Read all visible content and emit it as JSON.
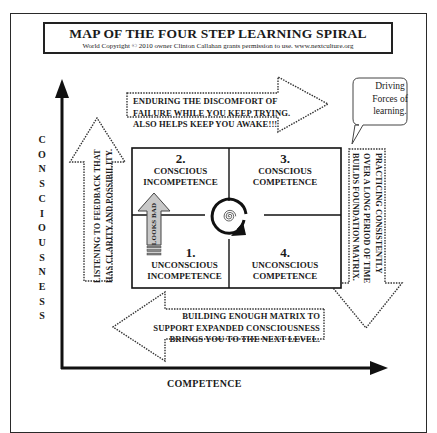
{
  "title": {
    "main": "MAP OF THE FOUR STEP LEARNING SPIRAL",
    "subtitle": "World Copyright © 2010 owner Clinton Callahan grants permission to use. www.nextculture.org"
  },
  "axes": {
    "y_label_letters": [
      "C",
      "O",
      "N",
      "S",
      "C",
      "I",
      "O",
      "U",
      "S",
      "N",
      "E",
      "S",
      "S"
    ],
    "y_label": "CONSCIOUSNESS",
    "x_label": "COMPETENCE"
  },
  "quadrants": [
    {
      "number": "2.",
      "line1": "CONSCIOUS",
      "line2": "INCOMPETENCE"
    },
    {
      "number": "3.",
      "line1": "CONSCIOUS",
      "line2": "COMPETENCE"
    },
    {
      "number": "1.",
      "line1": "UNCONSCIOUS",
      "line2": "INCOMPETENCE"
    },
    {
      "number": "4.",
      "line1": "UNCONSCIOUS",
      "line2": "COMPETENCE"
    }
  ],
  "arrows": {
    "top": {
      "lines": [
        "ENDURING THE DISCOMFORT OF",
        "FAILURE WHILE YOU KEEP TRYING.",
        "ALSO HELPS KEEP YOU AWAKE!!!"
      ]
    },
    "right": {
      "lines": [
        "PRACTICING CONSISTENTLY",
        "OVER A LONG PERIOD OF TIME",
        "BUILDS FOUNDATION MATRIX."
      ]
    },
    "bottom": {
      "lines": [
        "BUILDING ENOUGH MATRIX TO",
        "SUPPORT EXPANDED CONSCIOUSNESS",
        "BRINGS YOU TO THE NEXT LEVEL."
      ]
    },
    "left": {
      "lines": [
        "LISTENING TO FEEDBACK THAT",
        "HAS CLARITY AND POSSIBILITY."
      ]
    },
    "looks_bad": "LOOKS BAD"
  },
  "callout": {
    "lines": [
      "Driving",
      "Forces of",
      "learning."
    ]
  }
}
